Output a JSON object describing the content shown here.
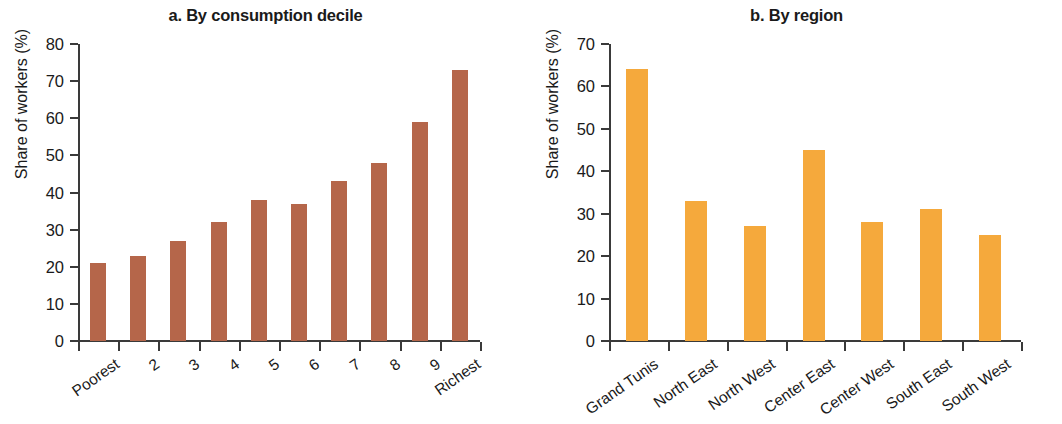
{
  "figure": {
    "background": "#ffffff",
    "panel_count": 2
  },
  "panels": {
    "a": {
      "title": "a. By consumption decile",
      "ylabel": "Share of workers (%)",
      "bar_color": "#b5664a"
    },
    "b": {
      "title": "b. By region",
      "ylabel": "Share of workers (%)",
      "bar_color": "#f5a93c"
    }
  },
  "chart_data": [
    {
      "type": "bar",
      "title": "a. By consumption decile",
      "xlabel": "",
      "ylabel": "Share of workers (%)",
      "ylim": [
        0,
        80
      ],
      "yticks": [
        0,
        10,
        20,
        30,
        40,
        50,
        60,
        70,
        80
      ],
      "grid": false,
      "legend": null,
      "bar_color": "#b5664a",
      "categories": [
        "Poorest",
        "2",
        "3",
        "4",
        "5",
        "6",
        "7",
        "8",
        "9",
        "Richest"
      ],
      "values": [
        21,
        23,
        27,
        32,
        38,
        37,
        43,
        48,
        59,
        73
      ]
    },
    {
      "type": "bar",
      "title": "b. By region",
      "xlabel": "",
      "ylabel": "Share of workers (%)",
      "ylim": [
        0,
        70
      ],
      "yticks": [
        0,
        10,
        20,
        30,
        40,
        50,
        60,
        70
      ],
      "grid": false,
      "legend": null,
      "bar_color": "#f5a93c",
      "categories": [
        "Grand Tunis",
        "North East",
        "North West",
        "Center East",
        "Center West",
        "South East",
        "South West"
      ],
      "values": [
        64,
        33,
        27,
        45,
        28,
        31,
        25
      ]
    }
  ]
}
